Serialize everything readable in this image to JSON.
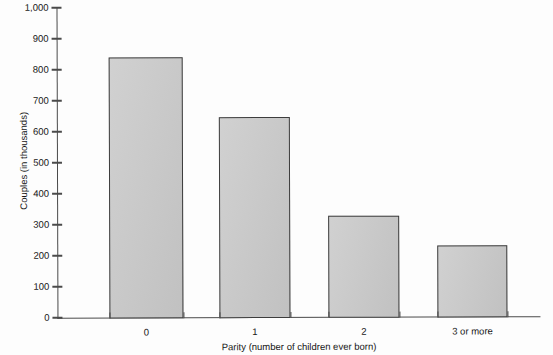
{
  "chart_data": {
    "type": "bar",
    "title": "",
    "categories": [
      "0",
      "1",
      "2",
      "3 or more"
    ],
    "values": [
      840,
      645,
      325,
      230
    ],
    "series": [
      {
        "name": "Couples",
        "values": [
          840,
          645,
          325,
          230
        ]
      }
    ],
    "xlabel": "Parity (number of children ever born)",
    "ylabel": "Couples (in thousands)",
    "ylim": [
      0,
      1000
    ],
    "y_ticks": [
      0,
      100,
      200,
      300,
      400,
      500,
      600,
      700,
      800,
      900,
      1000
    ],
    "y_tick_labels": [
      "0",
      "100",
      "200",
      "300",
      "400",
      "500",
      "600",
      "700",
      "800",
      "900",
      "1,000"
    ],
    "grid": false,
    "legend": null,
    "bar_fill_color": "#c8c8c8",
    "bar_edge_color": "#3d3d3d",
    "axis_color": "#4a4a4a",
    "background_color": "#ffffff"
  },
  "figure": {
    "clipped_title": "",
    "x_axis_title": "Parity (number of children ever born)",
    "y_axis_title": "Couples (in thousands)"
  }
}
